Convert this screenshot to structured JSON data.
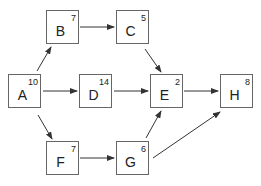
{
  "diagram": {
    "type": "activity-network",
    "nodes": [
      {
        "id": "A",
        "label": "A",
        "duration": "10",
        "x": 8,
        "y": 74
      },
      {
        "id": "B",
        "label": "B",
        "duration": "7",
        "x": 46,
        "y": 10
      },
      {
        "id": "C",
        "label": "C",
        "duration": "5",
        "x": 116,
        "y": 10
      },
      {
        "id": "D",
        "label": "D",
        "duration": "14",
        "x": 79,
        "y": 74
      },
      {
        "id": "E",
        "label": "E",
        "duration": "2",
        "x": 150,
        "y": 74
      },
      {
        "id": "H",
        "label": "H",
        "duration": "8",
        "x": 220,
        "y": 74
      },
      {
        "id": "F",
        "label": "F",
        "duration": "7",
        "x": 46,
        "y": 141
      },
      {
        "id": "G",
        "label": "G",
        "duration": "6",
        "x": 116,
        "y": 141
      }
    ],
    "edges": [
      {
        "from": "A",
        "to": "B"
      },
      {
        "from": "A",
        "to": "D"
      },
      {
        "from": "A",
        "to": "F"
      },
      {
        "from": "B",
        "to": "C"
      },
      {
        "from": "C",
        "to": "E"
      },
      {
        "from": "D",
        "to": "E"
      },
      {
        "from": "E",
        "to": "H"
      },
      {
        "from": "F",
        "to": "G"
      },
      {
        "from": "G",
        "to": "E"
      },
      {
        "from": "G",
        "to": "H"
      }
    ],
    "colors": {
      "line": "#333333",
      "border": "#666666",
      "text": "#222222"
    }
  }
}
